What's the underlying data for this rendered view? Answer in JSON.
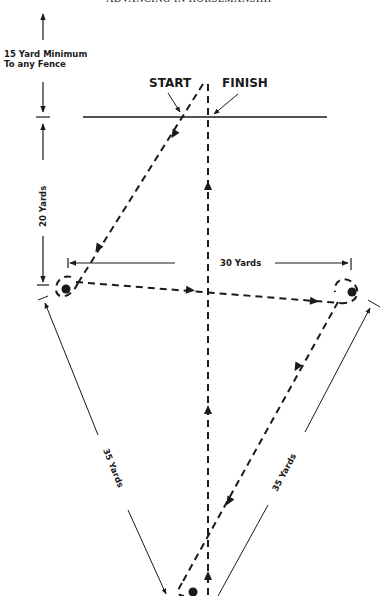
{
  "header": {
    "running_title": "ADVANCING IN HORSEMANSHIP"
  },
  "diagram": {
    "min_distance_label_line1": "15 Yard Minimum",
    "min_distance_label_line2": "To any Fence",
    "start_label": "START",
    "finish_label": "FINISH",
    "left_vertical_label": "20 Yards",
    "horizontal_label": "30 Yards",
    "left_diagonal_label": "35 Yards",
    "right_diagonal_label": "35 Yards",
    "markers": [
      "left-marker",
      "right-marker",
      "bottom-marker"
    ],
    "ink_color": "#1a1a1a"
  }
}
